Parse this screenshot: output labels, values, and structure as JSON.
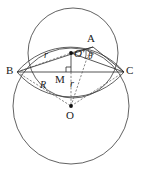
{
  "figure": {
    "type": "geometry-diagram",
    "width": 141,
    "height": 175,
    "background_color": "#ffffff",
    "stroke_color": "#333333",
    "label_color": "#1a1a1a"
  },
  "labels": {
    "point_a": "A",
    "point_b": "B",
    "point_c": "C",
    "point_o": "O",
    "point_o_prime": "O′",
    "point_m": "M",
    "radius_small_upper": "r",
    "radius_small_lower": "r",
    "radius_large": "R",
    "angle_theta": "θ"
  },
  "geometry": {
    "circle_upper": {
      "cx": 73,
      "cy": 53,
      "r": 45
    },
    "circle_lower": {
      "cx": 71,
      "cy": 106,
      "r": 58
    },
    "point_a": {
      "x": 93,
      "y": 47
    },
    "point_b": {
      "x": 17,
      "y": 72
    },
    "point_c": {
      "x": 124,
      "y": 72
    },
    "point_o": {
      "x": 71,
      "y": 106
    },
    "point_o_prime": {
      "x": 71,
      "y": 53
    },
    "point_m": {
      "x": 71,
      "y": 72
    }
  }
}
